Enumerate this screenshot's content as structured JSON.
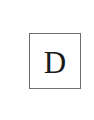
{
  "tile": {
    "letter": "D",
    "border_color": "#6e6e6e",
    "text_color": "#1a1a1a",
    "background": "#ffffff"
  }
}
